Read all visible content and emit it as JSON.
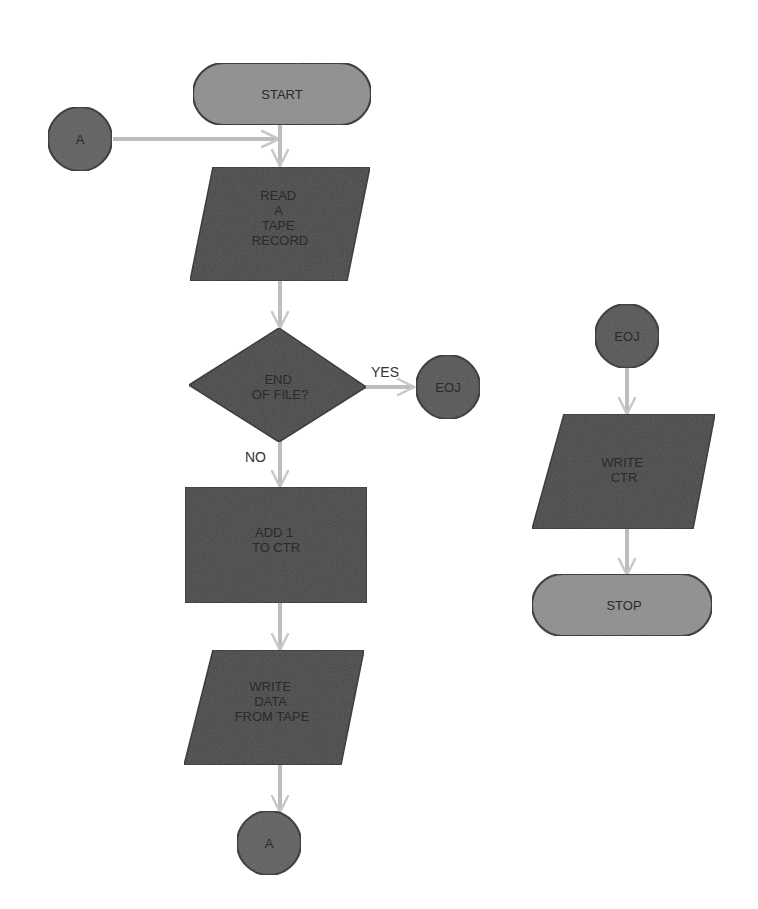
{
  "diagram": {
    "type": "flowchart",
    "colors": {
      "terminal_fill": "#8f8f8f",
      "process_fill": "#474747",
      "connector_fill": "#5e5e5e",
      "connector_eoj_fill": "#545454",
      "arrow": "#bdbdbd",
      "outline": "#2e2e2e",
      "background": "#ffffff"
    },
    "nodes": {
      "start": {
        "shape": "terminal",
        "label": "START"
      },
      "connector_a_in": {
        "shape": "connector",
        "label": "A"
      },
      "read_record": {
        "shape": "io",
        "lines": [
          "READ",
          "A",
          "TAPE",
          "RECORD"
        ]
      },
      "end_of_file": {
        "shape": "decision",
        "lines": [
          "END",
          "OF FILE?"
        ]
      },
      "eoj_out": {
        "shape": "connector",
        "label": "EOJ"
      },
      "add_counter": {
        "shape": "process",
        "lines": [
          "ADD 1",
          "TO CTR"
        ]
      },
      "write_data": {
        "shape": "io",
        "lines": [
          "WRITE",
          "DATA",
          "FROM TAPE"
        ]
      },
      "connector_a_out": {
        "shape": "connector",
        "label": "A"
      },
      "eoj_in": {
        "shape": "connector",
        "label": "EOJ"
      },
      "write_ctr": {
        "shape": "io",
        "lines": [
          "WRITE",
          "CTR"
        ]
      },
      "stop": {
        "shape": "terminal",
        "label": "STOP"
      }
    },
    "edges": {
      "yes_label": "YES",
      "no_label": "NO"
    }
  }
}
